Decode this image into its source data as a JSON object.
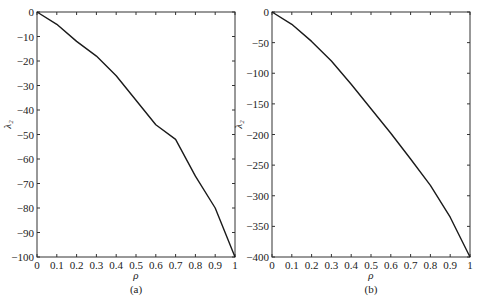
{
  "chart_data": [
    {
      "type": "line",
      "panel": "(a)",
      "caption": "(a)",
      "xlabel": "ρ",
      "ylabel": "λ₂",
      "xlim": [
        0,
        1
      ],
      "ylim": [
        -100,
        0
      ],
      "xticks": [
        "0",
        "0.1",
        "0.2",
        "0.3",
        "0.4",
        "0.5",
        "0.6",
        "0.7",
        "0.8",
        "0.9",
        "1"
      ],
      "yticks": [
        "0",
        "-10",
        "-20",
        "-30",
        "-40",
        "-50",
        "-60",
        "-70",
        "-80",
        "-90",
        "-100"
      ],
      "grid": false,
      "x": [
        0,
        0.1,
        0.2,
        0.3,
        0.4,
        0.5,
        0.6,
        0.7,
        0.8,
        0.9,
        1.0
      ],
      "series": [
        {
          "name": "λ2",
          "values": [
            0,
            -5,
            -12,
            -18,
            -26,
            -36,
            -46,
            -52,
            -67,
            -80,
            -100
          ]
        }
      ]
    },
    {
      "type": "line",
      "panel": "(b)",
      "caption": "(b)",
      "xlabel": "ρ",
      "ylabel": "λ₂",
      "xlim": [
        0,
        1
      ],
      "ylim": [
        -400,
        0
      ],
      "xticks": [
        "0",
        "0.1",
        "0.2",
        "0.3",
        "0.4",
        "0.5",
        "0.6",
        "0.7",
        "0.8",
        "0.9",
        "1"
      ],
      "yticks": [
        "0",
        "-50",
        "-100",
        "-150",
        "-200",
        "-250",
        "-300",
        "-350",
        "-400"
      ],
      "grid": false,
      "x": [
        0,
        0.1,
        0.2,
        0.3,
        0.4,
        0.5,
        0.6,
        0.7,
        0.8,
        0.9,
        1.0
      ],
      "series": [
        {
          "name": "λ2",
          "values": [
            0,
            -20,
            -48,
            -80,
            -118,
            -158,
            -198,
            -240,
            -283,
            -335,
            -400
          ]
        }
      ]
    }
  ],
  "colors": {
    "line": "#1a1a1a",
    "axis": "#333333"
  }
}
